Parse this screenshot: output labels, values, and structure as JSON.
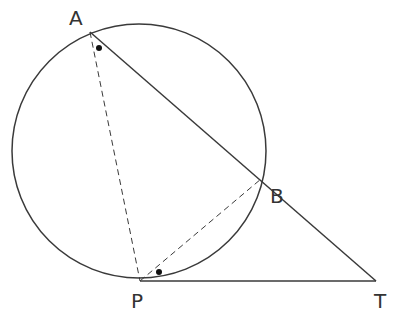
{
  "diagram": {
    "stroke_color": "#3a3a3a",
    "circle": {
      "cx": 139,
      "cy": 151,
      "r": 127
    },
    "points": {
      "A": {
        "label": "A",
        "x": 90,
        "y": 32,
        "label_x": 69,
        "label_y": 25
      },
      "B": {
        "label": "B",
        "x": 261,
        "y": 179,
        "label_x": 270,
        "label_y": 203
      },
      "P": {
        "label": "P",
        "x": 140,
        "y": 281,
        "label_x": 131,
        "label_y": 308
      },
      "T": {
        "label": "T",
        "x": 376,
        "y": 281,
        "label_x": 374,
        "label_y": 308
      }
    },
    "solid_segments": [
      "AT",
      "PT"
    ],
    "dashed_segments": [
      "AP",
      "PB"
    ],
    "angle_markers": [
      {
        "at": "A",
        "x": 99,
        "y": 48,
        "meaning": "angle PAB"
      },
      {
        "at": "P",
        "x": 159,
        "y": 272,
        "meaning": "angle BPT"
      }
    ]
  }
}
